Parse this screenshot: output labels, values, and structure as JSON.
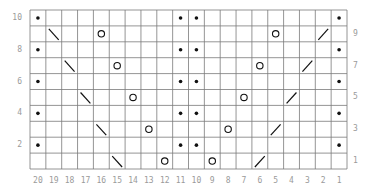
{
  "chart": {
    "columns": 20,
    "rows": 10,
    "column_labels": [
      "20",
      "19",
      "18",
      "17",
      "16",
      "15",
      "14",
      "13",
      "12",
      "11",
      "10",
      "9",
      "8",
      "7",
      "6",
      "5",
      "4",
      "3",
      "2",
      "1"
    ],
    "left_row_labels": [
      {
        "row": 10,
        "label": "10"
      },
      {
        "row": 8,
        "label": "8"
      },
      {
        "row": 6,
        "label": "6"
      },
      {
        "row": 4,
        "label": "4"
      },
      {
        "row": 2,
        "label": "2"
      }
    ],
    "right_row_labels": [
      {
        "row": 9,
        "label": "9"
      },
      {
        "row": 7,
        "label": "7"
      },
      {
        "row": 5,
        "label": "5"
      },
      {
        "row": 3,
        "label": "3"
      },
      {
        "row": 1,
        "label": "1"
      }
    ],
    "legend_symbols": {
      "dot": "purl (dot)",
      "circle": "yarn over (O)",
      "backslash": "left-leaning decrease (\\)",
      "slash": "right-leaning decrease (/)"
    },
    "cells": [
      {
        "row": 10,
        "col": 20,
        "symbol": "dot"
      },
      {
        "row": 10,
        "col": 11,
        "symbol": "dot"
      },
      {
        "row": 10,
        "col": 10,
        "symbol": "dot"
      },
      {
        "row": 10,
        "col": 1,
        "symbol": "dot"
      },
      {
        "row": 9,
        "col": 19,
        "symbol": "backslash"
      },
      {
        "row": 9,
        "col": 16,
        "symbol": "circle"
      },
      {
        "row": 9,
        "col": 5,
        "symbol": "circle"
      },
      {
        "row": 9,
        "col": 2,
        "symbol": "slash"
      },
      {
        "row": 8,
        "col": 20,
        "symbol": "dot"
      },
      {
        "row": 8,
        "col": 11,
        "symbol": "dot"
      },
      {
        "row": 8,
        "col": 10,
        "symbol": "dot"
      },
      {
        "row": 8,
        "col": 1,
        "symbol": "dot"
      },
      {
        "row": 7,
        "col": 18,
        "symbol": "backslash"
      },
      {
        "row": 7,
        "col": 15,
        "symbol": "circle"
      },
      {
        "row": 7,
        "col": 6,
        "symbol": "circle"
      },
      {
        "row": 7,
        "col": 3,
        "symbol": "slash"
      },
      {
        "row": 6,
        "col": 20,
        "symbol": "dot"
      },
      {
        "row": 6,
        "col": 11,
        "symbol": "dot"
      },
      {
        "row": 6,
        "col": 10,
        "symbol": "dot"
      },
      {
        "row": 6,
        "col": 1,
        "symbol": "dot"
      },
      {
        "row": 5,
        "col": 17,
        "symbol": "backslash"
      },
      {
        "row": 5,
        "col": 14,
        "symbol": "circle"
      },
      {
        "row": 5,
        "col": 7,
        "symbol": "circle"
      },
      {
        "row": 5,
        "col": 4,
        "symbol": "slash"
      },
      {
        "row": 4,
        "col": 20,
        "symbol": "dot"
      },
      {
        "row": 4,
        "col": 11,
        "symbol": "dot"
      },
      {
        "row": 4,
        "col": 10,
        "symbol": "dot"
      },
      {
        "row": 4,
        "col": 1,
        "symbol": "dot"
      },
      {
        "row": 3,
        "col": 16,
        "symbol": "backslash"
      },
      {
        "row": 3,
        "col": 13,
        "symbol": "circle"
      },
      {
        "row": 3,
        "col": 8,
        "symbol": "circle"
      },
      {
        "row": 3,
        "col": 5,
        "symbol": "slash"
      },
      {
        "row": 2,
        "col": 20,
        "symbol": "dot"
      },
      {
        "row": 2,
        "col": 11,
        "symbol": "dot"
      },
      {
        "row": 2,
        "col": 10,
        "symbol": "dot"
      },
      {
        "row": 2,
        "col": 1,
        "symbol": "dot"
      },
      {
        "row": 1,
        "col": 15,
        "symbol": "backslash"
      },
      {
        "row": 1,
        "col": 12,
        "symbol": "circle"
      },
      {
        "row": 1,
        "col": 9,
        "symbol": "circle"
      },
      {
        "row": 1,
        "col": 6,
        "symbol": "slash"
      }
    ],
    "colors": {
      "grid_line": "#7a7a7a",
      "symbol": "#111111",
      "label": "#9a9a9a",
      "background": "#ffffff"
    }
  }
}
